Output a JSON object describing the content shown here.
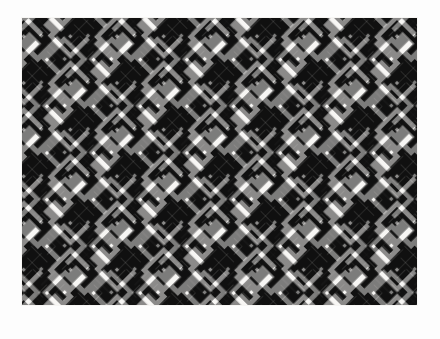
{
  "page": {
    "background_color": "#fdfdfd",
    "width": 440,
    "height": 339
  },
  "figure": {
    "name": "geometric-meander-pattern",
    "title": "Diagonal Greek-key meander tiling",
    "bounds": {
      "x": 21,
      "y": 17,
      "width": 397,
      "height": 289
    },
    "colors": {
      "ink": "#111111",
      "ground": "#f7f6f4",
      "page": "#fdfdfd"
    },
    "geometry": {
      "motif": "diagonal-meander-spiral",
      "lattice": "45-degree diagonal grid",
      "cell_size_px": 33,
      "stroke_width_px": 5.5,
      "gap_width_px": 5.5,
      "rotation_deg": 45,
      "dot_size_px": 5,
      "orientation_alternates": true,
      "columns_across": 12,
      "rows_down": 9
    }
  }
}
